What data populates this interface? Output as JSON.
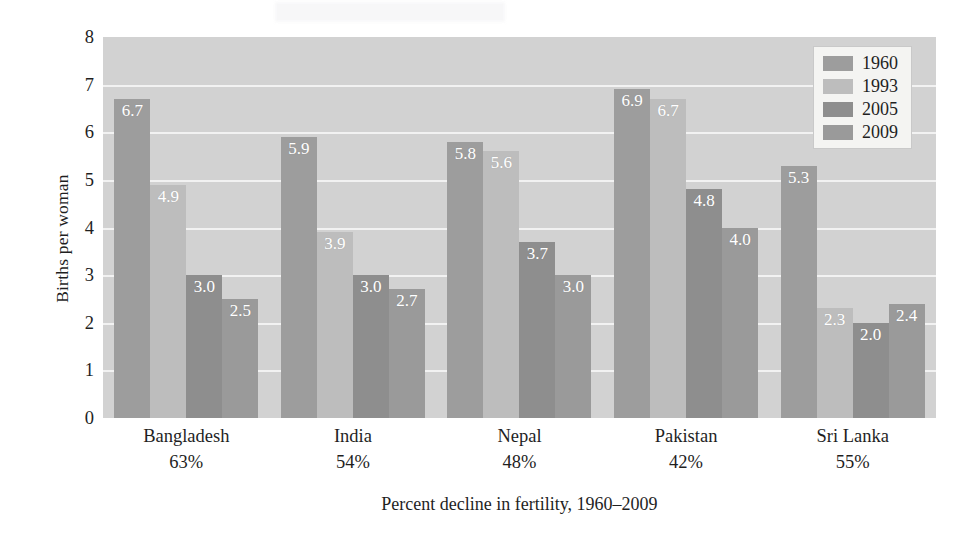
{
  "chart_data": {
    "type": "bar",
    "title": "",
    "xlabel": "Percent decline in fertility, 1960–2009",
    "ylabel": "Births per woman",
    "ylim": [
      0,
      8
    ],
    "yticks": [
      0,
      1,
      2,
      3,
      4,
      5,
      6,
      7,
      8
    ],
    "grid": true,
    "legend_position": "top-right",
    "categories": [
      "Bangladesh",
      "India",
      "Nepal",
      "Pakistan",
      "Sri Lanka"
    ],
    "category_sublabels": [
      "63%",
      "54%",
      "48%",
      "42%",
      "55%"
    ],
    "series": [
      {
        "name": "1960",
        "color": "#9d9d9d",
        "values": [
          6.7,
          5.9,
          5.8,
          6.9,
          5.3
        ]
      },
      {
        "name": "1993",
        "color": "#bdbdbd",
        "values": [
          4.9,
          3.9,
          5.6,
          6.7,
          2.3
        ]
      },
      {
        "name": "2005",
        "color": "#8e8e8e",
        "values": [
          3.0,
          3.0,
          3.7,
          4.8,
          2.0
        ]
      },
      {
        "name": "2009",
        "color": "#9a9a9a",
        "values": [
          2.5,
          2.7,
          3.0,
          4.0,
          2.4
        ]
      }
    ],
    "bar_value_labels": [
      [
        "6.7",
        "4.9",
        "3.0",
        "2.5"
      ],
      [
        "5.9",
        "3.9",
        "3.0",
        "2.7"
      ],
      [
        "5.8",
        "5.6",
        "3.7",
        "3.0"
      ],
      [
        "6.9",
        "6.7",
        "4.8",
        "4.0"
      ],
      [
        "5.3",
        "2.3",
        "2.0",
        "2.4"
      ]
    ],
    "plot_background": "#d2d2d2",
    "gridline_color": "#f4f4f4"
  },
  "legend": {
    "entries": [
      {
        "label": "1960"
      },
      {
        "label": "1993"
      },
      {
        "label": "2005"
      },
      {
        "label": "2009"
      }
    ]
  }
}
